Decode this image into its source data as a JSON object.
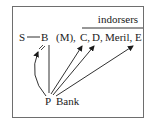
{
  "diagram": {
    "header_label": "indorsers",
    "parties": {
      "s": "S",
      "b": "B",
      "m": "(M),",
      "c": "C,",
      "d": "D,",
      "meril": "Meril,",
      "e": "E"
    },
    "bottom": {
      "p": "P",
      "bank": "Bank"
    },
    "colors": {
      "line": "#1a1a1a",
      "border": "#6e6e6e"
    }
  }
}
